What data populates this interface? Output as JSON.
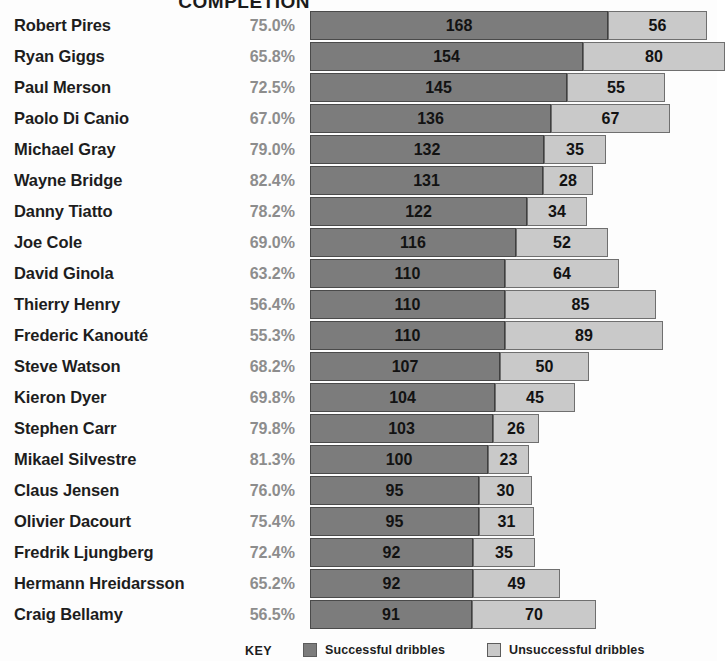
{
  "chart_data": {
    "type": "bar",
    "subtype": "horizontal-stacked",
    "title": "COMPLETION",
    "xlabel": "",
    "ylabel": "",
    "grid": false,
    "legend_position": "bottom",
    "categories": [
      "Robert Pires",
      "Ryan Giggs",
      "Paul Merson",
      "Paolo Di Canio",
      "Michael Gray",
      "Wayne Bridge",
      "Danny Tiatto",
      "Joe Cole",
      "David Ginola",
      "Thierry Henry",
      "Frederic Kanouté",
      "Steve Watson",
      "Kieron Dyer",
      "Stephen Carr",
      "Mikael Silvestre",
      "Claus Jensen",
      "Olivier Dacourt",
      "Fredrik Ljungberg",
      "Hermann Hreidarsson",
      "Craig Bellamy"
    ],
    "series": [
      {
        "name": "Successful dribbles",
        "color": "#7c7c7c",
        "values": [
          168,
          154,
          145,
          136,
          132,
          131,
          122,
          116,
          110,
          110,
          110,
          107,
          104,
          103,
          100,
          95,
          95,
          92,
          92,
          91
        ]
      },
      {
        "name": "Unsuccessful dribbles",
        "color": "#c9c9c9",
        "values": [
          56,
          80,
          55,
          67,
          35,
          28,
          34,
          52,
          64,
          85,
          89,
          50,
          45,
          26,
          23,
          30,
          31,
          35,
          49,
          70
        ]
      }
    ],
    "completion_label": "COMPLETION",
    "completion": [
      "75.0%",
      "65.8%",
      "72.5%",
      "67.0%",
      "79.0%",
      "82.4%",
      "78.2%",
      "69.0%",
      "63.2%",
      "56.4%",
      "55.3%",
      "68.2%",
      "69.8%",
      "79.8%",
      "81.3%",
      "76.0%",
      "75.4%",
      "72.4%",
      "65.2%",
      "56.5%"
    ],
    "xlim": [
      0,
      224
    ],
    "px_per_unit": 1.775
  },
  "legend": {
    "key_label": "KEY",
    "items": [
      {
        "label": "Successful dribbles",
        "color": "#7c7c7c"
      },
      {
        "label": "Unsuccessful dribbles",
        "color": "#c9c9c9"
      }
    ]
  }
}
